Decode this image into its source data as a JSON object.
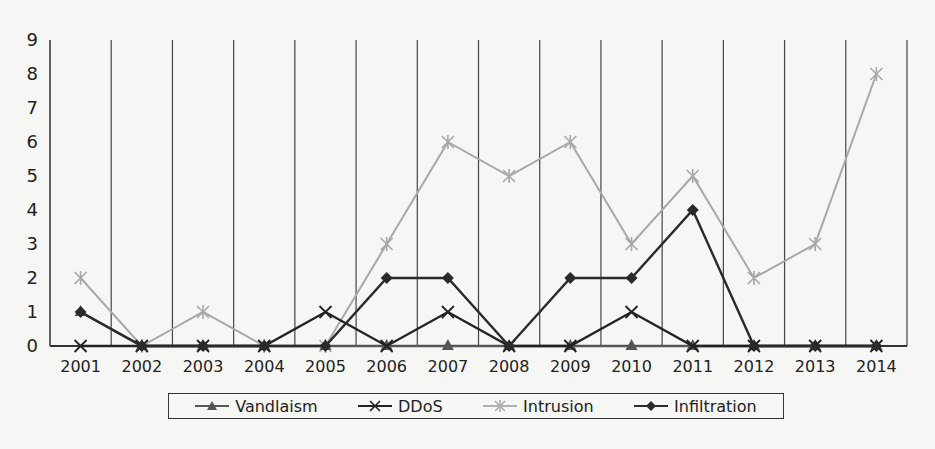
{
  "chart_data": {
    "type": "line",
    "title": "",
    "xlabel": "",
    "ylabel": "",
    "ylim": [
      0,
      9
    ],
    "yticks": [
      0,
      1,
      2,
      3,
      4,
      5,
      6,
      7,
      8,
      9
    ],
    "categories": [
      "2001",
      "2002",
      "2003",
      "2004",
      "2005",
      "2006",
      "2007",
      "2008",
      "2009",
      "2010",
      "2011",
      "2012",
      "2013",
      "2014"
    ],
    "grid": "vertical lines between categories",
    "legend_position": "bottom",
    "series": [
      {
        "name": "Vandlaism",
        "marker": "triangle",
        "color": "#555555",
        "values": [
          1,
          0,
          0,
          0,
          0,
          0,
          0,
          0,
          0,
          0,
          0,
          0,
          0,
          0
        ]
      },
      {
        "name": "DDoS",
        "marker": "x",
        "color": "#222222",
        "values": [
          0,
          0,
          0,
          0,
          1,
          0,
          1,
          0,
          0,
          1,
          0,
          0,
          0,
          0
        ]
      },
      {
        "name": "Intrusion",
        "marker": "star",
        "color": "#a8a8a8",
        "values": [
          2,
          0,
          1,
          0,
          0,
          3,
          6,
          5,
          6,
          3,
          5,
          2,
          3,
          8
        ]
      },
      {
        "name": "Infiltration",
        "marker": "diamond",
        "color": "#2a2a2a",
        "values": [
          1,
          0,
          0,
          0,
          0,
          2,
          2,
          0,
          2,
          2,
          4,
          0,
          0,
          0
        ]
      }
    ]
  },
  "legend": {
    "items": [
      {
        "label": "Vandlaism"
      },
      {
        "label": "DDoS"
      },
      {
        "label": "Intrusion"
      },
      {
        "label": "Infiltration"
      }
    ]
  }
}
